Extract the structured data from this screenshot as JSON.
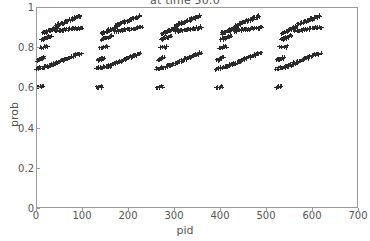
{
  "chart_data": {
    "type": "scatter",
    "title": "at time 50.0",
    "xlabel": "pid",
    "ylabel": "prob",
    "xlim": [
      0,
      700
    ],
    "ylim": [
      0,
      1
    ],
    "xticks": [
      0,
      100,
      200,
      300,
      400,
      500,
      600,
      700
    ],
    "xtick_labels": [
      "0",
      "100",
      "200",
      "300",
      "400",
      "500",
      "600",
      "700"
    ],
    "yticks": [
      0,
      0.2,
      0.4,
      0.6,
      0.8,
      1
    ],
    "ytick_labels": [
      "0",
      "0.2",
      "0.4",
      "0.6",
      "0.8",
      "1"
    ],
    "grid": false,
    "legend": null,
    "marker": "plus",
    "marker_color": "#2b2b2b",
    "group_count": 5,
    "group_pitch": 130,
    "group_span": 112,
    "groups": [
      {
        "index": 0,
        "pid_start": 2,
        "bands": [
          {
            "name": "low-band",
            "pid_from": 2,
            "pid_to": 14,
            "prob_from": 0.601,
            "prob_to": 0.604,
            "count": 7
          },
          {
            "name": "mid-band-low",
            "pid_from": 2,
            "pid_to": 30,
            "prob_from": 0.693,
            "prob_to": 0.706,
            "count": 16
          },
          {
            "name": "mid-band-step",
            "pid_from": 4,
            "pid_to": 18,
            "prob_from": 0.735,
            "prob_to": 0.748,
            "count": 14
          },
          {
            "name": "mid-band-rise",
            "pid_from": 26,
            "pid_to": 98,
            "prob_from": 0.705,
            "prob_to": 0.772,
            "count": 42
          },
          {
            "name": "upper-shelf",
            "pid_from": 10,
            "pid_to": 26,
            "prob_from": 0.8,
            "prob_to": 0.802,
            "count": 7
          },
          {
            "name": "upper-band-low",
            "pid_from": 12,
            "pid_to": 34,
            "prob_from": 0.838,
            "prob_to": 0.856,
            "count": 18
          },
          {
            "name": "upper-band-mid",
            "pid_from": 14,
            "pid_to": 46,
            "prob_from": 0.868,
            "prob_to": 0.9,
            "count": 26
          },
          {
            "name": "upper-band-flat",
            "pid_from": 42,
            "pid_to": 100,
            "prob_from": 0.88,
            "prob_to": 0.898,
            "count": 30
          },
          {
            "name": "upper-band-high",
            "pid_from": 44,
            "pid_to": 96,
            "prob_from": 0.908,
            "prob_to": 0.955,
            "count": 36
          }
        ]
      },
      {
        "index": 1,
        "pid_start": 132,
        "bands": [
          {
            "name": "low-band",
            "pid_from": 132,
            "pid_to": 144,
            "prob_from": 0.601,
            "prob_to": 0.604,
            "count": 7
          },
          {
            "name": "mid-band-low",
            "pid_from": 132,
            "pid_to": 160,
            "prob_from": 0.693,
            "prob_to": 0.706,
            "count": 16
          },
          {
            "name": "mid-band-step",
            "pid_from": 134,
            "pid_to": 148,
            "prob_from": 0.735,
            "prob_to": 0.748,
            "count": 14
          },
          {
            "name": "mid-band-rise",
            "pid_from": 156,
            "pid_to": 228,
            "prob_from": 0.705,
            "prob_to": 0.772,
            "count": 42
          },
          {
            "name": "upper-shelf",
            "pid_from": 140,
            "pid_to": 156,
            "prob_from": 0.8,
            "prob_to": 0.802,
            "count": 7
          },
          {
            "name": "upper-band-low",
            "pid_from": 142,
            "pid_to": 164,
            "prob_from": 0.838,
            "prob_to": 0.856,
            "count": 18
          },
          {
            "name": "upper-band-mid",
            "pid_from": 144,
            "pid_to": 176,
            "prob_from": 0.868,
            "prob_to": 0.9,
            "count": 26
          },
          {
            "name": "upper-band-flat",
            "pid_from": 172,
            "pid_to": 230,
            "prob_from": 0.88,
            "prob_to": 0.898,
            "count": 30
          },
          {
            "name": "upper-band-high",
            "pid_from": 174,
            "pid_to": 226,
            "prob_from": 0.908,
            "prob_to": 0.955,
            "count": 36
          }
        ]
      },
      {
        "index": 2,
        "pid_start": 262,
        "bands": [
          {
            "name": "low-band",
            "pid_from": 262,
            "pid_to": 274,
            "prob_from": 0.601,
            "prob_to": 0.604,
            "count": 7
          },
          {
            "name": "mid-band-low",
            "pid_from": 262,
            "pid_to": 290,
            "prob_from": 0.693,
            "prob_to": 0.706,
            "count": 16
          },
          {
            "name": "mid-band-step",
            "pid_from": 264,
            "pid_to": 278,
            "prob_from": 0.735,
            "prob_to": 0.748,
            "count": 14
          },
          {
            "name": "mid-band-rise",
            "pid_from": 286,
            "pid_to": 358,
            "prob_from": 0.705,
            "prob_to": 0.772,
            "count": 42
          },
          {
            "name": "upper-shelf",
            "pid_from": 270,
            "pid_to": 286,
            "prob_from": 0.8,
            "prob_to": 0.802,
            "count": 7
          },
          {
            "name": "upper-band-low",
            "pid_from": 272,
            "pid_to": 294,
            "prob_from": 0.838,
            "prob_to": 0.856,
            "count": 18
          },
          {
            "name": "upper-band-mid",
            "pid_from": 274,
            "pid_to": 306,
            "prob_from": 0.868,
            "prob_to": 0.9,
            "count": 26
          },
          {
            "name": "upper-band-flat",
            "pid_from": 302,
            "pid_to": 360,
            "prob_from": 0.88,
            "prob_to": 0.898,
            "count": 30
          },
          {
            "name": "upper-band-high",
            "pid_from": 304,
            "pid_to": 356,
            "prob_from": 0.908,
            "prob_to": 0.955,
            "count": 36
          }
        ]
      },
      {
        "index": 3,
        "pid_start": 392,
        "bands": [
          {
            "name": "low-band",
            "pid_from": 392,
            "pid_to": 404,
            "prob_from": 0.601,
            "prob_to": 0.604,
            "count": 7
          },
          {
            "name": "mid-band-low",
            "pid_from": 392,
            "pid_to": 420,
            "prob_from": 0.693,
            "prob_to": 0.706,
            "count": 16
          },
          {
            "name": "mid-band-step",
            "pid_from": 394,
            "pid_to": 408,
            "prob_from": 0.735,
            "prob_to": 0.748,
            "count": 14
          },
          {
            "name": "mid-band-rise",
            "pid_from": 416,
            "pid_to": 488,
            "prob_from": 0.705,
            "prob_to": 0.772,
            "count": 42
          },
          {
            "name": "upper-shelf",
            "pid_from": 400,
            "pid_to": 416,
            "prob_from": 0.8,
            "prob_to": 0.802,
            "count": 7
          },
          {
            "name": "upper-band-low",
            "pid_from": 402,
            "pid_to": 424,
            "prob_from": 0.838,
            "prob_to": 0.856,
            "count": 18
          },
          {
            "name": "upper-band-mid",
            "pid_from": 404,
            "pid_to": 436,
            "prob_from": 0.868,
            "prob_to": 0.9,
            "count": 26
          },
          {
            "name": "upper-band-flat",
            "pid_from": 432,
            "pid_to": 490,
            "prob_from": 0.88,
            "prob_to": 0.898,
            "count": 30
          },
          {
            "name": "upper-band-high",
            "pid_from": 434,
            "pid_to": 486,
            "prob_from": 0.908,
            "prob_to": 0.955,
            "count": 36
          }
        ]
      },
      {
        "index": 4,
        "pid_start": 522,
        "bands": [
          {
            "name": "low-band",
            "pid_from": 522,
            "pid_to": 534,
            "prob_from": 0.601,
            "prob_to": 0.604,
            "count": 7
          },
          {
            "name": "mid-band-low",
            "pid_from": 522,
            "pid_to": 550,
            "prob_from": 0.693,
            "prob_to": 0.706,
            "count": 16
          },
          {
            "name": "mid-band-step",
            "pid_from": 524,
            "pid_to": 538,
            "prob_from": 0.735,
            "prob_to": 0.748,
            "count": 14
          },
          {
            "name": "mid-band-rise",
            "pid_from": 546,
            "pid_to": 618,
            "prob_from": 0.705,
            "prob_to": 0.772,
            "count": 42
          },
          {
            "name": "upper-shelf",
            "pid_from": 530,
            "pid_to": 546,
            "prob_from": 0.8,
            "prob_to": 0.802,
            "count": 7
          },
          {
            "name": "upper-band-low",
            "pid_from": 532,
            "pid_to": 554,
            "prob_from": 0.838,
            "prob_to": 0.856,
            "count": 18
          },
          {
            "name": "upper-band-mid",
            "pid_from": 534,
            "pid_to": 566,
            "prob_from": 0.868,
            "prob_to": 0.9,
            "count": 26
          },
          {
            "name": "upper-band-flat",
            "pid_from": 562,
            "pid_to": 620,
            "prob_from": 0.88,
            "prob_to": 0.898,
            "count": 30
          },
          {
            "name": "upper-band-high",
            "pid_from": 564,
            "pid_to": 616,
            "prob_from": 0.908,
            "prob_to": 0.955,
            "count": 36
          }
        ]
      }
    ]
  }
}
